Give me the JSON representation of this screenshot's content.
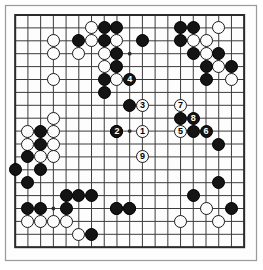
{
  "app": {
    "title": "Go Game Record Diagram",
    "board_size": 19,
    "colors": {
      "background": "#ffffff",
      "board": "#fdfdfd",
      "line": "#3b3b3b",
      "border": "#2b2b2b",
      "black_stone": "#141414",
      "white_stone": "#fcfcfc",
      "black_label": "#ffffff",
      "white_label": "#000000"
    }
  },
  "board": {
    "name": "go-board",
    "size": 19,
    "star_points": [
      {
        "col": 4,
        "row": 4
      },
      {
        "col": 10,
        "row": 4
      },
      {
        "col": 16,
        "row": 4
      },
      {
        "col": 4,
        "row": 10
      },
      {
        "col": 10,
        "row": 10
      },
      {
        "col": 16,
        "row": 10
      },
      {
        "col": 4,
        "row": 16
      },
      {
        "col": 10,
        "row": 16
      },
      {
        "col": 16,
        "row": 16
      }
    ],
    "black_stones": [
      {
        "col": 8,
        "row": 2
      },
      {
        "col": 9,
        "row": 2
      },
      {
        "col": 14,
        "row": 2
      },
      {
        "col": 15,
        "row": 2
      },
      {
        "col": 6,
        "row": 3
      },
      {
        "col": 8,
        "row": 3
      },
      {
        "col": 11,
        "row": 3
      },
      {
        "col": 14,
        "row": 3
      },
      {
        "col": 9,
        "row": 4
      },
      {
        "col": 15,
        "row": 4
      },
      {
        "col": 17,
        "row": 4
      },
      {
        "col": 9,
        "row": 5
      },
      {
        "col": 16,
        "row": 5
      },
      {
        "col": 18,
        "row": 5
      },
      {
        "col": 8,
        "row": 6
      },
      {
        "col": 16,
        "row": 6
      },
      {
        "col": 8,
        "row": 7
      },
      {
        "col": 10,
        "row": 8
      },
      {
        "col": 14,
        "row": 9
      },
      {
        "col": 9,
        "row": 10
      },
      {
        "col": 15,
        "row": 10
      },
      {
        "col": 17,
        "row": 11
      },
      {
        "col": 3,
        "row": 10
      },
      {
        "col": 3,
        "row": 11
      },
      {
        "col": 2,
        "row": 12
      },
      {
        "col": 3,
        "row": 13
      },
      {
        "col": 1,
        "row": 13
      },
      {
        "col": 2,
        "row": 14
      },
      {
        "col": 17,
        "row": 14
      },
      {
        "col": 5,
        "row": 15
      },
      {
        "col": 6,
        "row": 15
      },
      {
        "col": 7,
        "row": 15
      },
      {
        "col": 15,
        "row": 15
      },
      {
        "col": 2,
        "row": 16
      },
      {
        "col": 3,
        "row": 16
      },
      {
        "col": 5,
        "row": 16
      },
      {
        "col": 9,
        "row": 16
      },
      {
        "col": 10,
        "row": 16
      },
      {
        "col": 18,
        "row": 16
      },
      {
        "col": 7,
        "row": 18
      }
    ],
    "white_stones": [
      {
        "col": 7,
        "row": 2
      },
      {
        "col": 17,
        "row": 2
      },
      {
        "col": 4,
        "row": 3
      },
      {
        "col": 7,
        "row": 3
      },
      {
        "col": 9,
        "row": 3
      },
      {
        "col": 15,
        "row": 3
      },
      {
        "col": 16,
        "row": 3
      },
      {
        "col": 4,
        "row": 4
      },
      {
        "col": 6,
        "row": 4
      },
      {
        "col": 8,
        "row": 4
      },
      {
        "col": 16,
        "row": 4
      },
      {
        "col": 8,
        "row": 5
      },
      {
        "col": 17,
        "row": 5
      },
      {
        "col": 4,
        "row": 6
      },
      {
        "col": 9,
        "row": 6
      },
      {
        "col": 18,
        "row": 6
      },
      {
        "col": 4,
        "row": 9
      },
      {
        "col": 2,
        "row": 10
      },
      {
        "col": 4,
        "row": 10
      },
      {
        "col": 2,
        "row": 11
      },
      {
        "col": 4,
        "row": 11
      },
      {
        "col": 3,
        "row": 12
      },
      {
        "col": 4,
        "row": 12
      },
      {
        "col": 9,
        "row": 16
      },
      {
        "col": 10,
        "row": 16
      },
      {
        "col": 2,
        "row": 17
      },
      {
        "col": 3,
        "row": 17
      },
      {
        "col": 4,
        "row": 17
      },
      {
        "col": 5,
        "row": 17
      },
      {
        "col": 14,
        "row": 17
      },
      {
        "col": 17,
        "row": 17
      },
      {
        "col": 6,
        "row": 18
      },
      {
        "col": 16,
        "row": 16
      }
    ],
    "numbered_moves": [
      {
        "number": "1",
        "color": "white",
        "col": 11,
        "row": 10
      },
      {
        "number": "2",
        "color": "black",
        "col": 9,
        "row": 10
      },
      {
        "number": "3",
        "color": "white",
        "col": 11,
        "row": 8
      },
      {
        "number": "4",
        "color": "black",
        "col": 10,
        "row": 6
      },
      {
        "number": "5",
        "color": "white",
        "col": 14,
        "row": 10
      },
      {
        "number": "6",
        "color": "black",
        "col": 16,
        "row": 10
      },
      {
        "number": "7",
        "color": "white",
        "col": 14,
        "row": 8
      },
      {
        "number": "8",
        "color": "black",
        "col": 15,
        "row": 9
      },
      {
        "number": "9",
        "color": "white",
        "col": 11,
        "row": 12
      }
    ]
  }
}
